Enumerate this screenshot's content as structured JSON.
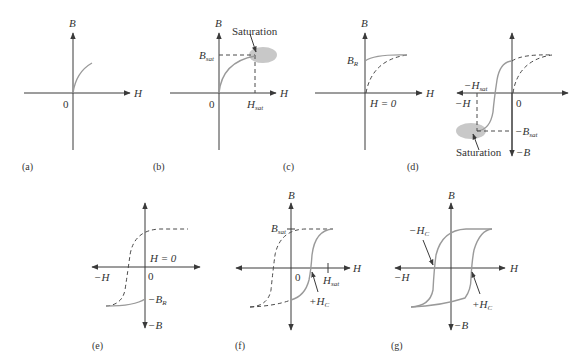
{
  "figure": {
    "panels": [
      {
        "id": "a",
        "caption": "(a)",
        "axis_b": "B",
        "axis_h": "H",
        "origin": "0"
      },
      {
        "id": "b",
        "caption": "(b)",
        "axis_b": "B",
        "axis_h": "H",
        "origin": "0",
        "b_sat": "B",
        "b_sat_sub": "sat",
        "h_sat": "H",
        "h_sat_sub": "sat",
        "annotation": "Saturation"
      },
      {
        "id": "c",
        "caption": "(c)",
        "axis_b": "B",
        "axis_h": "H",
        "b_r": "B",
        "b_r_sub": "R",
        "h_zero": "H = 0"
      },
      {
        "id": "d",
        "caption": "(d)",
        "neg_h": "−H",
        "neg_b": "−B",
        "origin": "0",
        "neg_h_sat": "−H",
        "neg_h_sat_sub": "sat",
        "neg_b_sat": "−B",
        "neg_b_sat_sub": "sat",
        "annotation": "Saturation"
      },
      {
        "id": "e",
        "caption": "(e)",
        "neg_h": "−H",
        "neg_b": "−B",
        "origin": "0",
        "h_zero": "H = 0",
        "neg_b_r": "−B",
        "neg_b_r_sub": "R"
      },
      {
        "id": "f",
        "caption": "(f)",
        "axis_b": "B",
        "axis_h": "H",
        "origin": "0",
        "b_sat": "B",
        "b_sat_sub": "sat",
        "h_sat": "H",
        "h_sat_sub": "sat",
        "pos_h_c": "+H",
        "pos_h_c_sub": "C"
      },
      {
        "id": "g",
        "caption": "(g)",
        "axis_b": "B",
        "axis_h": "H",
        "neg_h": "−H",
        "neg_b": "−B",
        "neg_h_c": "−H",
        "neg_h_c_sub": "C",
        "pos_h_c": "+H",
        "pos_h_c_sub": "C"
      }
    ]
  },
  "colors": {
    "axis": "#3a3a3a",
    "curve": "#9a9a9a",
    "saturation_region": "#c8c8c8"
  }
}
